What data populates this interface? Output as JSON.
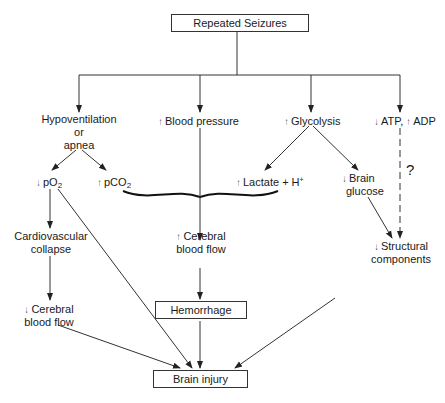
{
  "diagram": {
    "boxes": {
      "top": "Repeated Seizures",
      "hemorrhage": "Hemorrhage",
      "brain_injury": "Brain injury"
    },
    "nodes": {
      "hypoventilation": [
        "Hypoventilation",
        "or",
        "apnea"
      ],
      "blood_pressure": {
        "arrow": "↑",
        "text": "Blood pressure"
      },
      "glycolysis": {
        "arrow": "↑",
        "text": "Glycolysis"
      },
      "atp": {
        "arrow": "↓",
        "text": "ATP,"
      },
      "adp": {
        "arrow": "↑",
        "text": "ADP"
      },
      "po2": {
        "arrow": "↓",
        "text": "pO",
        "sub": "2"
      },
      "pco2": {
        "arrow": "↑",
        "text": "pCO",
        "sub": "2"
      },
      "lactate": {
        "arrow": "↑",
        "text": "Lactate + H",
        "sup": "+"
      },
      "brain_glucose": {
        "arrow": "↓",
        "lines": [
          "Brain",
          "glucose"
        ]
      },
      "cardiovascular": [
        "Cardiovascular",
        "collapse"
      ],
      "cerebral_up": {
        "arrow": "↑",
        "lines": [
          "Cerebral",
          "blood flow"
        ]
      },
      "cerebral_down": {
        "arrow": "↓",
        "lines": [
          "Cerebral",
          "blood flow"
        ]
      },
      "structural": {
        "arrow": "↓",
        "lines": [
          "Structural",
          "components"
        ]
      },
      "question": "?"
    },
    "colors": {
      "line": "#333333",
      "text": "#1a1a1a",
      "background": "#ffffff"
    }
  }
}
